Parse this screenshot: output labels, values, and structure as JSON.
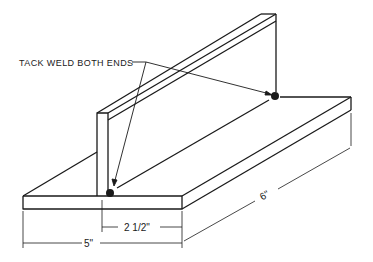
{
  "diagram": {
    "callout": {
      "label": "TACK WELD BOTH ENDS"
    },
    "dimensions": {
      "offset": "2 1/2\"",
      "width": "5\"",
      "length": "6\""
    },
    "colors": {
      "line": "#1a1a1a",
      "background": "#ffffff"
    }
  }
}
